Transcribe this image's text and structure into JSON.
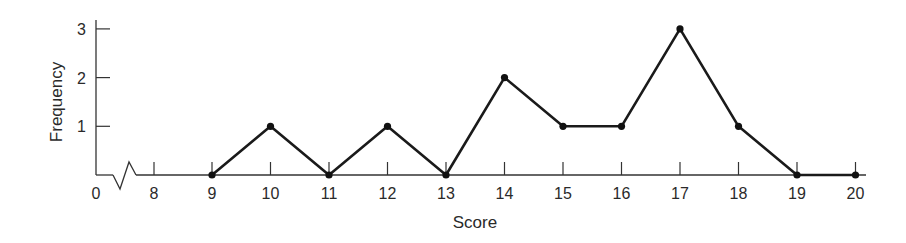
{
  "chart_data": {
    "type": "line",
    "title": "",
    "xlabel": "Score",
    "ylabel": "Frequency",
    "x": [
      9,
      10,
      11,
      12,
      13,
      14,
      15,
      16,
      17,
      18,
      19,
      20
    ],
    "values": [
      0,
      1,
      0,
      1,
      0,
      2,
      1,
      1,
      3,
      1,
      0,
      0
    ],
    "x_tick_labels": [
      "0",
      "8",
      "9",
      "10",
      "11",
      "12",
      "13",
      "14",
      "15",
      "16",
      "17",
      "18",
      "19",
      "20"
    ],
    "y_tick_labels": [
      "1",
      "2",
      "3"
    ],
    "ylim": [
      0,
      3
    ],
    "xlim": [
      0,
      20
    ],
    "axis_break": "between 0 and 8 on x-axis",
    "grid": false,
    "legend": null,
    "markers": true,
    "line_color": "#1a1a1a"
  }
}
